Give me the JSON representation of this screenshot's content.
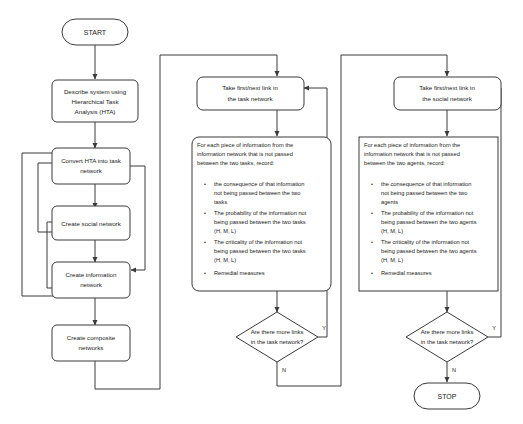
{
  "diagram": {
    "colors": {
      "stroke": "#3a3a3a",
      "text": "#1a1a1a",
      "background": "#ffffff"
    },
    "start": {
      "label": "START"
    },
    "stop": {
      "label": "STOP"
    },
    "left_column": {
      "describe": {
        "lines": [
          "Describe system using",
          "Hierarchical Task",
          "Analysis (HTA)"
        ]
      },
      "convert_hta": {
        "lines": [
          "Convert HTA into task",
          "network"
        ]
      },
      "social_network": {
        "lines": [
          "Create social network"
        ]
      },
      "information_network": {
        "lines": [
          "Create information",
          "network"
        ]
      },
      "composite_networks": {
        "lines": [
          "Create composite",
          "networks"
        ]
      }
    },
    "task_branch": {
      "take_link": {
        "lines": [
          "Take first/next link in",
          "the task network"
        ]
      },
      "record": {
        "header": [
          "For each piece of information from the",
          "information network that is not passed",
          "between the two tasks, record:"
        ],
        "bullets": [
          [
            "the consequence of that information",
            "not being passed between the two",
            "tasks"
          ],
          [
            "The probability of the information not",
            "being passed between the two tasks",
            "(H, M, L)"
          ],
          [
            "The criticality of the information not",
            "being passed between the two tasks",
            "(H, M, L)"
          ],
          [
            "Remedial measures"
          ]
        ]
      },
      "decision": {
        "lines": [
          "Are there more links",
          "in the task network?"
        ],
        "yes_label": "Y",
        "no_label": "N"
      }
    },
    "social_branch": {
      "take_link": {
        "lines": [
          "Take first/next link in",
          "the social network"
        ]
      },
      "record": {
        "header": [
          "For each piece of information from the",
          "information network that is not passed",
          "between the two agents, record:"
        ],
        "bullets": [
          [
            "the consequence of that information",
            "not being passed between the two",
            "agents"
          ],
          [
            "The probability of the information not",
            "being passed between the two agents",
            "(H, M, L)"
          ],
          [
            "The criticality of the information not",
            "being passed between the two agents",
            "(H, M, L)"
          ],
          [
            "Remedial measures"
          ]
        ]
      },
      "decision": {
        "lines": [
          "Are there more links",
          "in the task network?"
        ],
        "yes_label": "Y",
        "no_label": "N"
      }
    },
    "bullet_glyph": "•"
  }
}
